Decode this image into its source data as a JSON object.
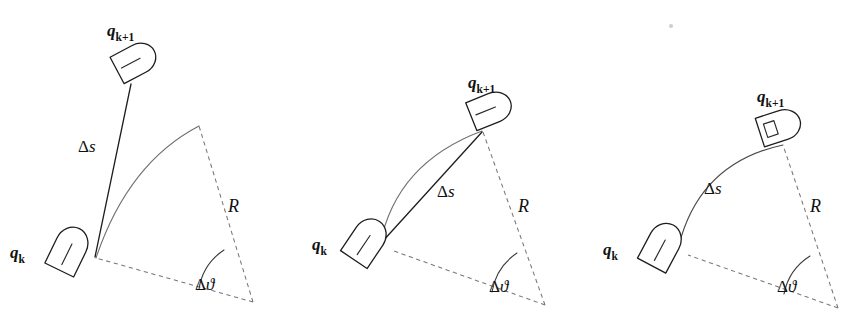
{
  "figure": {
    "background_color": "#ffffff",
    "ink_color": "#1d1d1d",
    "dashed_color": "#777777",
    "arc_color": "#6f6f6f",
    "width": 867,
    "height": 332,
    "panel_count": 3
  },
  "labels": {
    "q_base": "q",
    "q_k_sub": "k",
    "q_k1_sub": "k+1",
    "delta": "Δ",
    "s": "s",
    "theta": "ϑ",
    "radius": "R",
    "delta_s": "Δs",
    "delta_theta": "Δϑ"
  },
  "panels": [
    {
      "id": "panel-left",
      "index": 1,
      "caption_meaning": "straight-line (Euler) approximation: Δs drawn as tangent segment, robot q_{k+1} placed off the true arc",
      "delta_s_kind": "tangent-segment",
      "pose_start": {
        "name": "q_k",
        "label": "q",
        "subscript": "k",
        "x": 68,
        "y": 252,
        "heading_deg": -64
      },
      "pose_end": {
        "name": "q_k+1",
        "label": "q",
        "subscript": "k+1",
        "x": 133,
        "y": 62,
        "heading_deg": -28
      },
      "rotation_center": {
        "x": 253,
        "y": 302
      },
      "radius_label": "R",
      "angle_label": "Δϑ",
      "delta_s_label": "Δs",
      "label_positions": {
        "q_k": {
          "x": 10,
          "y": 248
        },
        "q_k1": {
          "x": 107,
          "y": 30
        },
        "delta_s": {
          "x": 78,
          "y": 145
        },
        "R": {
          "x": 228,
          "y": 205
        },
        "delta_theta": {
          "x": 197,
          "y": 283
        }
      }
    },
    {
      "id": "panel-middle",
      "index": 2,
      "caption_meaning": "chord approximation: Δs drawn as the straight chord from q_k to q_{k+1} which lies on the arc",
      "delta_s_kind": "chord",
      "pose_start": {
        "name": "q_k",
        "label": "q",
        "subscript": "k",
        "x": 365,
        "y": 243,
        "heading_deg": -56
      },
      "pose_end": {
        "name": "q_k+1",
        "label": "q",
        "subscript": "k+1",
        "x": 488,
        "y": 110,
        "heading_deg": -22
      },
      "rotation_center": {
        "x": 545,
        "y": 305
      },
      "radius_label": "R",
      "angle_label": "Δϑ",
      "delta_s_label": "Δs",
      "label_positions": {
        "q_k": {
          "x": 312,
          "y": 240
        },
        "q_k1": {
          "x": 468,
          "y": 82
        },
        "delta_s": {
          "x": 437,
          "y": 190
        },
        "R": {
          "x": 518,
          "y": 205
        },
        "delta_theta": {
          "x": 492,
          "y": 285
        }
      }
    },
    {
      "id": "panel-right",
      "index": 3,
      "caption_meaning": "exact arc integration: Δs is the arc length itself, robot follows the circular path",
      "delta_s_kind": "arc-length",
      "pose_start": {
        "name": "q_k",
        "label": "q",
        "subscript": "k",
        "x": 661,
        "y": 248,
        "heading_deg": -62
      },
      "pose_end": {
        "name": "q_k+1",
        "label": "q",
        "subscript": "k+1",
        "x": 777,
        "y": 127,
        "heading_deg": -18
      },
      "rotation_center": {
        "x": 838,
        "y": 308
      },
      "radius_label": "R",
      "angle_label": "Δϑ",
      "delta_s_label": "Δs",
      "label_positions": {
        "q_k": {
          "x": 603,
          "y": 246
        },
        "q_k1": {
          "x": 757,
          "y": 96
        },
        "delta_s": {
          "x": 704,
          "y": 187
        },
        "R": {
          "x": 810,
          "y": 205
        },
        "delta_theta": {
          "x": 780,
          "y": 285
        }
      }
    }
  ],
  "artifacts": [
    {
      "name": "scan-speck",
      "x": 671,
      "y": 26,
      "r": 2.1
    }
  ]
}
